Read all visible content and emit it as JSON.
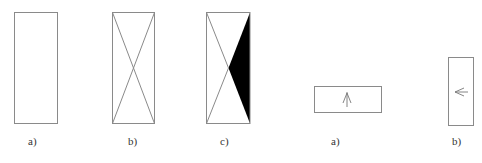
{
  "figure": {
    "left_group": {
      "panels": [
        {
          "id": "a",
          "label": "a)",
          "content": "empty-rectangle"
        },
        {
          "id": "b",
          "label": "b)",
          "content": "rectangle-with-diagonals"
        },
        {
          "id": "c",
          "label": "c)",
          "content": "rectangle-with-diagonals-right-triangle-filled"
        }
      ]
    },
    "right_group": {
      "panels": [
        {
          "id": "a",
          "label": "a)",
          "content": "horizontal-rectangle-with-up-arrow"
        },
        {
          "id": "b",
          "label": "b)",
          "content": "vertical-rectangle-with-left-arrow"
        }
      ]
    },
    "colors": {
      "stroke": "#8a8a8a",
      "fill": "#000000",
      "background": "#ffffff"
    }
  }
}
